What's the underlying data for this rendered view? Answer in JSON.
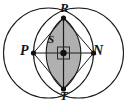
{
  "figure": {
    "canvas": {
      "width": 127,
      "height": 104
    },
    "colors": {
      "background": "#ffffff",
      "stroke": "#1a1a1a",
      "lens_fill": "#b0b0b0",
      "label_color": "#141414",
      "marker_fill": "#111111"
    },
    "geometry": {
      "left_circle": {
        "cx": 48.5,
        "cy": 53,
        "r": 45
      },
      "right_circle": {
        "cx": 78.5,
        "cy": 53,
        "r": 45
      },
      "lens_top": {
        "x": 63.5,
        "y": 18
      },
      "lens_bottom": {
        "x": 63.5,
        "y": 89
      },
      "axis_left": {
        "x": 33.5,
        "y": 53
      },
      "axis_right": {
        "x": 93.5,
        "y": 53
      },
      "center": {
        "x": 63.5,
        "y": 53
      },
      "center_marker": {
        "type": "square",
        "size": 12,
        "dot_radius": 3.2
      }
    },
    "points": [
      {
        "id": "R",
        "label": "R",
        "role": "lens-top-vertex",
        "x": 63.5,
        "y": 18,
        "label_x": 60,
        "label_y": 1
      },
      {
        "id": "T",
        "label": "T",
        "role": "lens-bottom-vertex",
        "x": 63.5,
        "y": 89,
        "label_x": 60,
        "label_y": 89
      },
      {
        "id": "P",
        "label": "P",
        "role": "left-axis-endpoint",
        "x": 33.5,
        "y": 53,
        "label_x": 20,
        "label_y": 44
      },
      {
        "id": "N",
        "label": "N",
        "role": "right-axis-endpoint",
        "x": 93.5,
        "y": 53,
        "label_x": 93,
        "label_y": 44
      },
      {
        "id": "S",
        "label": "S",
        "role": "center-point",
        "x": 63.5,
        "y": 53,
        "label_x": 48,
        "label_y": 34
      }
    ],
    "segments": [
      {
        "id": "PN",
        "from": "P",
        "to": "N",
        "kind": "horizontal-axis"
      },
      {
        "id": "RT",
        "from": "R",
        "to": "T",
        "kind": "vertical-axis"
      },
      {
        "id": "RP",
        "from": "R",
        "to": "P",
        "kind": "rhombus-edge"
      },
      {
        "id": "RN",
        "from": "R",
        "to": "N",
        "kind": "rhombus-edge"
      },
      {
        "id": "TP",
        "from": "T",
        "to": "P",
        "kind": "rhombus-edge"
      },
      {
        "id": "TN",
        "from": "T",
        "to": "N",
        "kind": "rhombus-edge"
      }
    ]
  }
}
